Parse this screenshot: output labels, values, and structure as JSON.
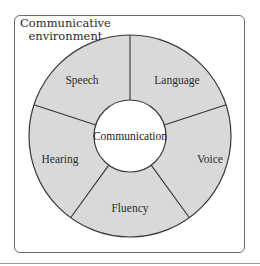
{
  "diagram": {
    "outer_label_line1": "Communicative",
    "outer_label_line2": "environment",
    "center_label": "Communication",
    "segments": [
      {
        "label": "Speech"
      },
      {
        "label": "Language"
      },
      {
        "label": "Voice"
      },
      {
        "label": "Fluency"
      },
      {
        "label": "Hearing"
      }
    ],
    "colors": {
      "ring_fill": "#d9d9d9",
      "stroke": "#3a3a3a",
      "center_fill": "#ffffff",
      "frame": "#6a6a6a"
    }
  }
}
